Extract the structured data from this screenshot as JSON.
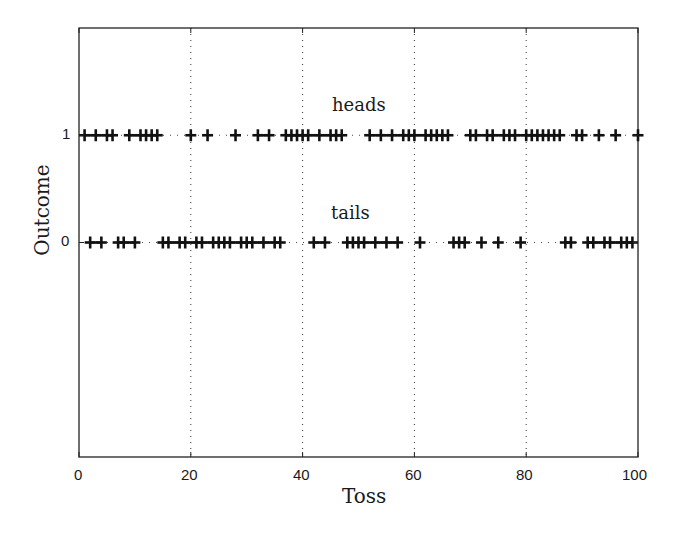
{
  "chart_data": {
    "type": "scatter",
    "title": "",
    "xlabel": "Toss",
    "ylabel": "Outcome",
    "xlim": [
      0,
      100
    ],
    "ylim": [
      -2,
      2
    ],
    "xticks": [
      0,
      20,
      40,
      60,
      80,
      100
    ],
    "yticks": [
      0,
      1
    ],
    "grid": {
      "x": true,
      "y": false,
      "style": "dotted"
    },
    "marker": "+",
    "annotations": [
      {
        "text": "heads",
        "x": 45,
        "y": 1.2
      },
      {
        "text": "tails",
        "x": 45,
        "y": 0.2
      }
    ],
    "series": [
      {
        "name": "heads",
        "y": 1,
        "x": [
          1,
          3,
          5,
          6,
          9,
          11,
          12,
          13,
          14,
          20,
          23,
          28,
          32,
          34,
          37,
          38,
          39,
          40,
          41,
          43,
          45,
          46,
          47,
          52,
          54,
          56,
          58,
          59,
          60,
          62,
          63,
          64,
          65,
          66,
          70,
          71,
          73,
          74,
          76,
          77,
          78,
          80,
          81,
          82,
          83,
          84,
          85,
          86,
          89,
          90,
          93,
          96,
          100
        ]
      },
      {
        "name": "tails",
        "y": 0,
        "x": [
          2,
          4,
          7,
          8,
          10,
          15,
          16,
          18,
          19,
          21,
          22,
          24,
          25,
          26,
          27,
          29,
          30,
          31,
          33,
          35,
          36,
          42,
          44,
          48,
          49,
          50,
          51,
          53,
          55,
          57,
          61,
          67,
          68,
          69,
          72,
          75,
          79,
          87,
          88,
          91,
          92,
          94,
          95,
          97,
          98,
          99
        ]
      }
    ]
  },
  "labels": {
    "xlabel": "Toss",
    "ylabel": "Outcome",
    "heads": "heads",
    "tails": "tails",
    "xticks": [
      "0",
      "20",
      "40",
      "60",
      "80",
      "100"
    ],
    "yticks": [
      "0",
      "1"
    ]
  }
}
